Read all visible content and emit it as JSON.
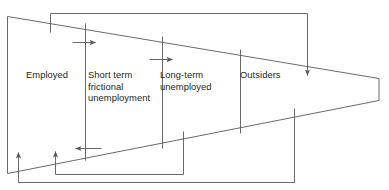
{
  "diagram": {
    "type": "flow-wedge",
    "segments": [
      {
        "id": "employed",
        "label": "Employed"
      },
      {
        "id": "short-term",
        "label": "Short term\nfrictional\nunemployment"
      },
      {
        "id": "long-term",
        "label": "Long-term\nunemployed"
      },
      {
        "id": "outsiders",
        "label": "Outsiders"
      }
    ],
    "flows": [
      {
        "id": "employed-to-short-term",
        "direction": "right",
        "from": "Employed",
        "to": "Short term frictional unemployment"
      },
      {
        "id": "short-term-to-long-term",
        "direction": "right",
        "from": "Short term frictional unemployment",
        "to": "Long-term unemployed"
      },
      {
        "id": "short-term-to-employed",
        "direction": "left",
        "from": "Short term frictional unemployment",
        "to": "Employed"
      },
      {
        "id": "outsiders-inflow",
        "direction": "down",
        "from": "Employed",
        "to": "Outsiders"
      },
      {
        "id": "long-term-to-employed",
        "direction": "up",
        "from": "Long-term unemployed",
        "to": "Short term frictional unemployment"
      },
      {
        "id": "outsiders-to-employed",
        "direction": "up",
        "from": "Outsiders",
        "to": "Employed"
      }
    ],
    "colors": {
      "stroke": "#58595b",
      "text": "#231f20",
      "background": "#ffffff"
    },
    "cropped_top_text": {
      "left": "",
      "right": ""
    }
  }
}
